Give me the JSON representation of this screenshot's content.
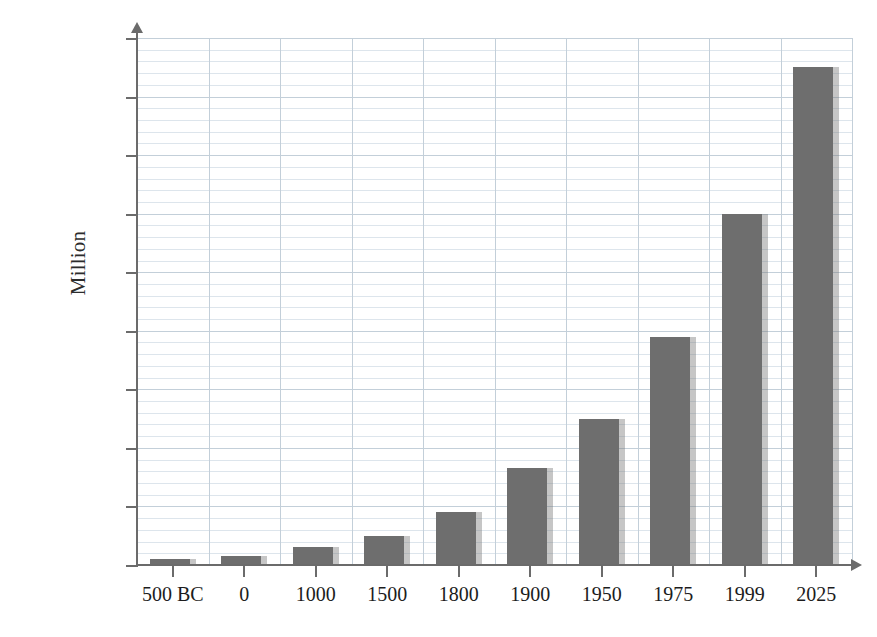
{
  "chart_data": {
    "type": "bar",
    "title": "",
    "subtitle": "",
    "xlabel": "",
    "ylabel": "Million",
    "categories": [
      "500 BC",
      "0",
      "1000",
      "1500",
      "1800",
      "1900",
      "1950",
      "1975",
      "1999",
      "2025"
    ],
    "values": [
      100,
      150,
      310,
      490,
      900,
      1650,
      2500,
      3900,
      6000,
      8500
    ],
    "series": [
      {
        "name": "World population",
        "values": [
          100,
          150,
          310,
          490,
          900,
          1650,
          2500,
          3900,
          6000,
          8500
        ]
      }
    ],
    "ylim": [
      0,
      9000
    ],
    "ytick_labels": [
      "0",
      "1000",
      "2000",
      "3000",
      "4000",
      "5000",
      "6000",
      "7000",
      "8000",
      "9000"
    ],
    "ytick_values": [
      0,
      1000,
      2000,
      3000,
      4000,
      5000,
      6000,
      7000,
      8000,
      9000
    ],
    "grid": true,
    "grid_axis": "y",
    "legend": false,
    "legend_position": "none",
    "annotations": []
  },
  "style": {
    "bar_color": "#6e6e6e",
    "bar_shadow_color": "#b4b4b4",
    "grid_major_color": "#c3cfd9",
    "grid_minor_color": "#dde5ec",
    "axis_color": "#6b6b6b",
    "text_color": "#1c1c1c",
    "background": "#ffffff"
  }
}
